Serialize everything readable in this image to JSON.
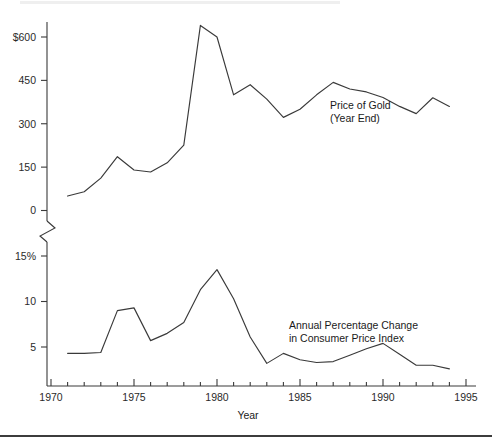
{
  "chart_data": {
    "type": "line",
    "title": "",
    "xlabel": "Year",
    "ylabel": "",
    "grid": false,
    "legend_position": "inline-annotation",
    "axis_break": true,
    "xlim": [
      1970,
      1995
    ],
    "x_ticks_major": [
      "1970",
      "1975",
      "1980",
      "1985",
      "1990",
      "1995"
    ],
    "x_tick_values": [
      1970,
      1975,
      1980,
      1985,
      1990,
      1995
    ],
    "x_minor_tick_interval": 1,
    "panels": [
      {
        "name": "gold",
        "ylim": [
          0,
          600
        ],
        "y_ticks": [
          "0",
          "150",
          "300",
          "450",
          "$600"
        ],
        "y_tick_values": [
          0,
          150,
          300,
          450,
          600
        ],
        "annotation_line1": "Price of Gold",
        "annotation_line2": "(Year End)",
        "series_name": "Price of Gold (Year End)",
        "x": [
          1971,
          1972,
          1973,
          1974,
          1975,
          1976,
          1977,
          1978,
          1979,
          1980,
          1981,
          1982,
          1983,
          1984,
          1985,
          1986,
          1987,
          1988,
          1989,
          1990,
          1991,
          1992,
          1993,
          1994
        ],
        "values": [
          50,
          65,
          112,
          186,
          140,
          133,
          165,
          226,
          640,
          600,
          400,
          435,
          385,
          322,
          350,
          400,
          443,
          420,
          410,
          391,
          360,
          335,
          390,
          360
        ]
      },
      {
        "name": "cpi",
        "ylim": [
          2,
          15
        ],
        "y_ticks": [
          "5",
          "10",
          "15%"
        ],
        "y_tick_values": [
          5,
          10,
          15
        ],
        "annotation_line1": "Annual Percentage Change",
        "annotation_line2": "in Consumer Price Index",
        "series_name": "Annual Percentage Change in Consumer Price Index",
        "x": [
          1971,
          1972,
          1973,
          1974,
          1975,
          1976,
          1977,
          1978,
          1979,
          1980,
          1981,
          1982,
          1983,
          1984,
          1985,
          1986,
          1987,
          1988,
          1989,
          1990,
          1991,
          1992,
          1993,
          1994
        ],
        "values": [
          4.3,
          4.3,
          4.4,
          9.0,
          9.3,
          5.7,
          6.5,
          7.7,
          11.3,
          13.5,
          10.3,
          6.1,
          3.2,
          4.3,
          3.6,
          3.3,
          3.4,
          4.1,
          4.8,
          5.4,
          4.2,
          3.0,
          3.0,
          2.6
        ]
      }
    ]
  },
  "axis": {
    "x_label": "Year"
  }
}
